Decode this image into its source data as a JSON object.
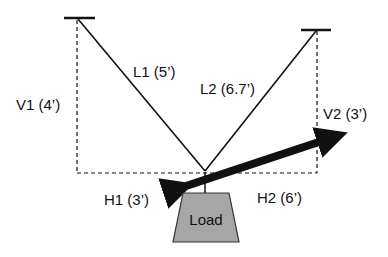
{
  "diagram": {
    "labels": {
      "l1": "L1 (5’)",
      "l2": "L2 (6.7’)",
      "v1": "V1 (4’)",
      "v2": "V2 (3’)",
      "h1": "H1 (3’)",
      "h2": "H2 (6’)",
      "load": "Load"
    },
    "colors": {
      "line": "#111111",
      "load_fill": "#a6a6a6",
      "load_stroke": "#333333",
      "background": "#ffffff"
    }
  }
}
